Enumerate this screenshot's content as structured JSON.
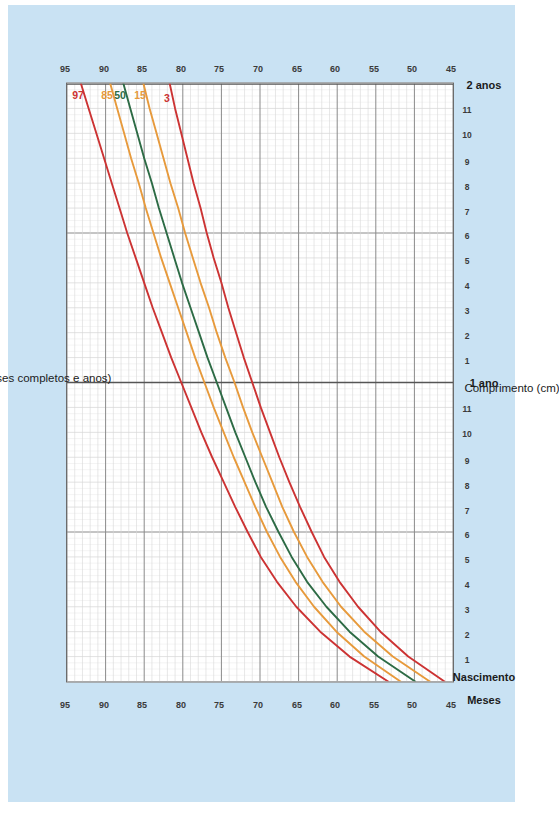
{
  "page": {
    "background_color": "#ffffff",
    "card_color": "#c9e2f3"
  },
  "axis_titles": {
    "y_title": "Comprimento (cm)",
    "x_title": "Idade (meses completos e anos)",
    "months_label": "Meses",
    "birth_label": "Nascimento",
    "year1_label": "1 ano",
    "year2_label": "2 anos"
  },
  "percentile_labels": [
    {
      "text": "97",
      "color": "#cc3333"
    },
    {
      "text": "85",
      "color": "#e79a3c"
    },
    {
      "text": "50",
      "color": "#2d6b45"
    },
    {
      "text": "15",
      "color": "#e79a3c"
    },
    {
      "text": "3",
      "color": "#cc3333"
    }
  ],
  "length_ticks": [
    "95",
    "90",
    "85",
    "80",
    "75",
    "70",
    "65",
    "60",
    "55",
    "50",
    "45"
  ],
  "month_ticks": [
    "1",
    "2",
    "3",
    "4",
    "5",
    "6",
    "7",
    "8",
    "9",
    "10",
    "11",
    "1",
    "2",
    "3",
    "4",
    "5",
    "6",
    "7",
    "8",
    "9",
    "10",
    "11"
  ],
  "colors": {
    "red": "#cc3333",
    "orange": "#e79a3c",
    "green": "#2d6b45",
    "grid_major": "#8a8a8a",
    "grid_minor": "#d6d6d6",
    "frame": "#6b6b6b",
    "text": "#1b1b1b"
  },
  "chart_data": {
    "type": "line",
    "title": "",
    "xlabel": "Idade (meses completos e anos)",
    "ylabel": "Comprimento (cm)",
    "xlim": [
      0,
      24
    ],
    "ylim": [
      45,
      95
    ],
    "x_unit": "months",
    "y_unit": "cm",
    "grid": true,
    "legend": "inline-end-labels",
    "x": [
      0,
      1,
      2,
      3,
      4,
      5,
      6,
      7,
      8,
      9,
      10,
      11,
      12,
      13,
      14,
      15,
      16,
      17,
      18,
      19,
      20,
      21,
      22,
      23,
      24
    ],
    "series": [
      {
        "name": "97",
        "color": "#cc3333",
        "values": [
          53.4,
          58.4,
          62.2,
          65.3,
          67.8,
          69.9,
          71.6,
          73.2,
          74.7,
          76.2,
          77.6,
          78.9,
          80.2,
          81.5,
          82.7,
          83.9,
          85.0,
          86.1,
          87.2,
          88.2,
          89.2,
          90.2,
          91.2,
          92.2,
          93.2
        ]
      },
      {
        "name": "85",
        "color": "#e79a3c",
        "values": [
          51.8,
          56.5,
          60.1,
          63.0,
          65.4,
          67.4,
          69.1,
          70.6,
          72.0,
          73.4,
          74.7,
          76.0,
          77.2,
          78.4,
          79.5,
          80.6,
          81.7,
          82.8,
          83.8,
          84.8,
          85.7,
          86.7,
          87.6,
          88.5,
          89.4
        ]
      },
      {
        "name": "50",
        "color": "#2d6b45",
        "values": [
          49.9,
          54.7,
          58.4,
          61.4,
          63.9,
          65.9,
          67.6,
          69.2,
          70.6,
          71.9,
          73.2,
          74.4,
          75.6,
          76.8,
          77.9,
          79.0,
          80.1,
          81.1,
          82.1,
          83.1,
          84.0,
          85.0,
          85.9,
          86.8,
          87.7
        ]
      },
      {
        "name": "15",
        "color": "#e79a3c",
        "values": [
          48.0,
          52.8,
          56.5,
          59.5,
          61.9,
          63.9,
          65.6,
          67.1,
          68.4,
          69.7,
          71.0,
          72.2,
          73.3,
          74.5,
          75.6,
          76.6,
          77.7,
          78.7,
          79.7,
          80.6,
          81.6,
          82.5,
          83.4,
          84.3,
          85.1
        ]
      },
      {
        "name": "3",
        "color": "#cc3333",
        "values": [
          46.1,
          50.8,
          54.4,
          57.3,
          59.7,
          61.7,
          63.3,
          64.8,
          66.2,
          67.5,
          68.7,
          69.9,
          71.0,
          72.1,
          73.1,
          74.1,
          75.0,
          76.0,
          76.9,
          77.7,
          78.6,
          79.4,
          80.2,
          81.0,
          81.7
        ]
      }
    ]
  }
}
